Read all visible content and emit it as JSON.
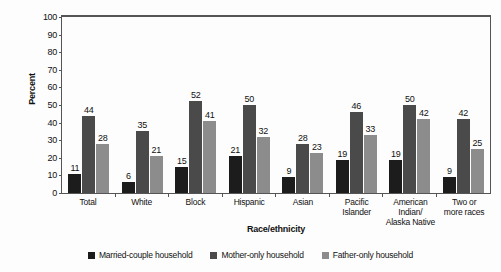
{
  "chart_data": {
    "type": "bar",
    "title": "",
    "xlabel": "Race/ethnicity",
    "ylabel": "Percent",
    "ylim": [
      0,
      100
    ],
    "ytick_step": 10,
    "yticks": [
      "100",
      "90",
      "80",
      "70",
      "60",
      "50",
      "40",
      "30",
      "20",
      "10",
      "0"
    ],
    "grid": false,
    "legend_position": "bottom",
    "categories": [
      "Total",
      "White",
      "Block",
      "Hispanic",
      "Asian",
      "Pacific Islander",
      "American Indian/ Alaska Native",
      "Two or more races"
    ],
    "category_lines": [
      [
        "Total"
      ],
      [
        "White"
      ],
      [
        "Block"
      ],
      [
        "Hispanic"
      ],
      [
        "Asian"
      ],
      [
        "Pacific",
        "Islander"
      ],
      [
        "American Indian/",
        "Alaska Native"
      ],
      [
        "Two or",
        "more races"
      ]
    ],
    "series": [
      {
        "name": "Married-couple household",
        "color": "#1c1c1c",
        "values": [
          11,
          6,
          15,
          21,
          9,
          19,
          19,
          9
        ]
      },
      {
        "name": "Mother-only household",
        "color": "#4a4a4a",
        "values": [
          44,
          35,
          52,
          50,
          28,
          46,
          50,
          42
        ]
      },
      {
        "name": "Father-only household",
        "color": "#8c8c8c",
        "values": [
          28,
          21,
          41,
          32,
          23,
          33,
          42,
          25
        ]
      }
    ]
  }
}
